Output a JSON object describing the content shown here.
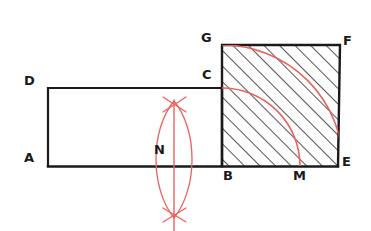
{
  "figure": {
    "background_color": "#ffffff",
    "ink_color": "#1a1a1a",
    "construction_color": "#e8635c",
    "hatch_color": "#2b2b2b",
    "labels": [
      {
        "id": "A",
        "text": "A",
        "x": 24,
        "y": 151
      },
      {
        "id": "D",
        "text": "D",
        "x": 24,
        "y": 74
      },
      {
        "id": "C",
        "text": "C",
        "x": 202,
        "y": 68
      },
      {
        "id": "G",
        "text": "G",
        "x": 201,
        "y": 31
      },
      {
        "id": "F",
        "text": "F",
        "x": 343,
        "y": 34
      },
      {
        "id": "E",
        "text": "E",
        "x": 342,
        "y": 155
      },
      {
        "id": "B",
        "text": "B",
        "x": 223,
        "y": 169
      },
      {
        "id": "M",
        "text": "M",
        "x": 293,
        "y": 169
      },
      {
        "id": "N",
        "text": "N",
        "x": 154,
        "y": 143
      }
    ],
    "points": {
      "A": {
        "x": 48,
        "y": 166
      },
      "D": {
        "x": 48,
        "y": 88
      },
      "C": {
        "x": 222,
        "y": 88
      },
      "B": {
        "x": 222,
        "y": 166
      },
      "G": {
        "x": 222,
        "y": 45
      },
      "F": {
        "x": 340,
        "y": 45
      },
      "E": {
        "x": 338,
        "y": 166
      },
      "M": {
        "x": 300,
        "y": 166
      },
      "N": {
        "x": 174,
        "y": 166
      },
      "arc_top_cross": {
        "x": 174,
        "y": 104
      },
      "arc_bottom_cross": {
        "x": 174,
        "y": 215
      }
    },
    "shapes": {
      "rectangle_ABCD": "A(48,166) D(48,88) C(222,88) B(222,166)",
      "square_BEFG": "B(222,166) E(338,166) F(340,45) G(222,45)",
      "hatched_region": "square BEFG",
      "hatch_angle_deg": 45,
      "hatch_spacing_px": 11
    },
    "construction": {
      "arc_outer_from": "G",
      "arc_outer_to": "M",
      "arc_inner_from": "C",
      "arc_inner_to": "M",
      "arc_center": "B",
      "bisector_line": "vertical through N from y=104 to y=231",
      "lens_arcs": "two arcs crossing at (174,104) and (174,215)"
    },
    "stroke_widths": {
      "ink": 2.2,
      "hatch": 1.1,
      "construction": 1.3
    }
  }
}
